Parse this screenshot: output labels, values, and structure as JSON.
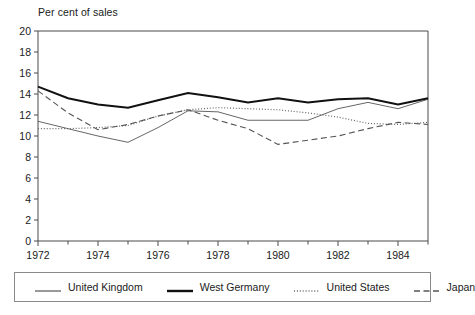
{
  "chart_data": {
    "type": "line",
    "title": "Per cent of sales",
    "xlabel": "",
    "ylabel": "Per cent of sales",
    "xlim": [
      1972,
      1985
    ],
    "ylim": [
      0,
      20
    ],
    "ytick_values": [
      0,
      2,
      4,
      6,
      8,
      10,
      12,
      14,
      16,
      18,
      20
    ],
    "ytick_labels": [
      "0",
      "2",
      "4",
      "6",
      "8",
      "10",
      "12",
      "14",
      "16",
      "18",
      "20"
    ],
    "xtick_values": [
      1972,
      1973,
      1974,
      1975,
      1976,
      1977,
      1978,
      1979,
      1980,
      1981,
      1982,
      1983,
      1984,
      1985
    ],
    "xtick_labels": [
      "1972",
      "",
      "1974",
      "",
      "1976",
      "",
      "1978",
      "",
      "1980",
      "",
      "1982",
      "",
      "1984",
      ""
    ],
    "x": [
      1972,
      1973,
      1974,
      1975,
      1976,
      1977,
      1978,
      1979,
      1980,
      1981,
      1982,
      1983,
      1984,
      1985
    ],
    "grid": false,
    "legend_position": "bottom",
    "series": [
      {
        "name": "United Kingdom",
        "style": "solid-thin",
        "color": "#555555",
        "values": [
          11.4,
          10.7,
          10.0,
          9.4,
          10.8,
          12.4,
          12.3,
          11.5,
          11.5,
          11.5,
          12.6,
          13.2,
          12.6,
          13.5
        ]
      },
      {
        "name": "West Germany",
        "style": "solid-thick",
        "color": "#111111",
        "values": [
          14.7,
          13.6,
          13.0,
          12.7,
          13.4,
          14.1,
          13.7,
          13.2,
          13.6,
          13.2,
          13.5,
          13.6,
          13.0,
          13.6
        ]
      },
      {
        "name": "United States",
        "style": "dotted",
        "color": "#666666",
        "values": [
          10.7,
          10.7,
          10.8,
          11.0,
          11.9,
          12.5,
          12.7,
          12.6,
          12.5,
          12.2,
          11.8,
          11.2,
          11.1,
          11.3
        ]
      },
      {
        "name": "Japan",
        "style": "dashed",
        "color": "#555555",
        "values": [
          14.3,
          12.2,
          10.6,
          11.1,
          11.9,
          12.5,
          11.5,
          10.7,
          9.2,
          9.6,
          10.0,
          10.7,
          11.3,
          11.1
        ]
      }
    ]
  },
  "legend": {
    "items": [
      {
        "label": "United Kingdom",
        "swatch": "solid-thin-swatch"
      },
      {
        "label": "West Germany",
        "swatch": "solid-thick-swatch"
      },
      {
        "label": "United States",
        "swatch": "dotted-swatch"
      },
      {
        "label": "Japan",
        "swatch": "dashed-swatch"
      }
    ]
  }
}
